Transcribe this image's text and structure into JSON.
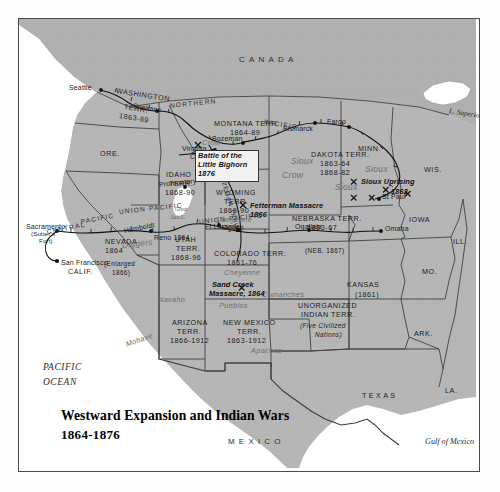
{
  "map": {
    "title_line1": "Westward Expansion and Indian Wars",
    "title_line2": "1864-1876",
    "colors": {
      "land": "#b6b6b6",
      "ocean": "#ffffff",
      "canada": "#b0b0b0",
      "border": "#4a4a4a",
      "tribe_text": "#6e6e6e",
      "ink": "#1a1a1a"
    },
    "countries": [
      {
        "name": "CANADA"
      },
      {
        "name": "MEXICO"
      }
    ],
    "oceans": [
      {
        "name": "PACIFIC",
        "name2": "OCEAN"
      }
    ],
    "waters": [
      {
        "name": "Gulf of Mexico"
      },
      {
        "name": "L. Superior"
      },
      {
        "name": "Great",
        "name2": "Salt L."
      }
    ],
    "states": [
      {
        "name": "WASHINGTON",
        "line2": "TERR.",
        "line3": "1863-89"
      },
      {
        "name": "ORE."
      },
      {
        "name": "IDAHO",
        "line2": "TERR.",
        "line3": "1868-90"
      },
      {
        "name": "MONTANA TERR.",
        "line2": "1864-89"
      },
      {
        "name": "DAKOTA TERR.",
        "line2": "1863-64",
        "line3": "1868-82"
      },
      {
        "name": "MINN."
      },
      {
        "name": "WIS."
      },
      {
        "name": "IOWA"
      },
      {
        "name": "ILL."
      },
      {
        "name": "MO."
      },
      {
        "name": "ARK."
      },
      {
        "name": "LA."
      },
      {
        "name": "TEXAS"
      },
      {
        "name": "KANSAS",
        "line2": "(1861)"
      },
      {
        "name": "NEBRASKA TERR.",
        "line2": "1863-67"
      },
      {
        "name": "(NEB. 1867)"
      },
      {
        "name": "WYOMING",
        "line2": "TERR.",
        "line3": "1868-90"
      },
      {
        "name": "UTAH",
        "line2": "TERR.",
        "line3": "1868-96"
      },
      {
        "name": "NEVADA",
        "line2": "1864",
        "line3": "(Enlarged",
        "line4": "1866)"
      },
      {
        "name": "CALIF."
      },
      {
        "name": "COLORADO TERR.",
        "line2": "1861-76"
      },
      {
        "name": "ARIZONA",
        "line2": "TERR.",
        "line3": "1866-1912"
      },
      {
        "name": "NEW MEXICO",
        "line2": "TERR.",
        "line3": "1863-1912"
      },
      {
        "name": "UNORGANIZED",
        "line2": "INDIAN TERR.",
        "line3": "(Five Civilized",
        "line4": "Nations)"
      }
    ],
    "cities": [
      {
        "name": "Seattle"
      },
      {
        "name": "Spokane"
      },
      {
        "name": "Virginia",
        "line2": "City"
      },
      {
        "name": "Bozeman"
      },
      {
        "name": "Bismarck"
      },
      {
        "name": "Fargo"
      },
      {
        "name": "St Paul"
      },
      {
        "name": "Omaha"
      },
      {
        "name": "Ogallala"
      },
      {
        "name": "Ft Laramie"
      },
      {
        "name": "Ogden"
      },
      {
        "name": "Promontory"
      },
      {
        "name": "Humboldt"
      },
      {
        "name": "Reno 1864"
      },
      {
        "name": "Sacramento",
        "line2": "(Sutter's",
        "line3": "Fort)"
      },
      {
        "name": "San Francisco"
      }
    ],
    "railroads": [
      {
        "name": "NORTHERN"
      },
      {
        "name": "PACIFIC"
      },
      {
        "name": "BOZEMAN TRAIL"
      },
      {
        "name": "UNION PACIFIC"
      },
      {
        "name": "CENTRAL PACIFIC"
      },
      {
        "name": "UNION"
      },
      {
        "name": "PACIFIC"
      },
      {
        "name": "CENTRAL"
      },
      {
        "name": "PACIFIC"
      }
    ],
    "tribes": [
      {
        "name": "Crow"
      },
      {
        "name": "Crow"
      },
      {
        "name": "Sioux"
      },
      {
        "name": "Sioux"
      },
      {
        "name": "Sioux"
      },
      {
        "name": "Cheyenne"
      },
      {
        "name": "Cheyenne"
      },
      {
        "name": "Comanches"
      },
      {
        "name": "Pueblos"
      },
      {
        "name": "Apaches"
      },
      {
        "name": "Navaho"
      },
      {
        "name": "Mohave"
      },
      {
        "name": "Diggers"
      }
    ],
    "events": [
      {
        "line1": "Battle of the",
        "line2": "Little Bighorn",
        "line3": "1876"
      },
      {
        "line1": "Fetterman Massacre",
        "line2": "1866"
      },
      {
        "line1": "Sioux Uprising",
        "line2": "1862"
      },
      {
        "line1": "Sand Creek",
        "line2": "Massacre, 1864"
      }
    ],
    "battle_markers": [
      {
        "symbol": "✕"
      },
      {
        "symbol": "✕"
      },
      {
        "symbol": "✕"
      },
      {
        "symbol": "✕"
      },
      {
        "symbol": "✕"
      },
      {
        "symbol": "✕"
      },
      {
        "symbol": "✕"
      },
      {
        "symbol": "✕"
      }
    ]
  }
}
